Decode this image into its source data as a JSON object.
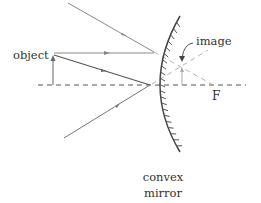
{
  "diagram": {
    "labels": {
      "object": "object",
      "image": "image",
      "focal_point": "F",
      "mirror_line1": "convex",
      "mirror_line2": "mirror"
    },
    "colors": {
      "ray": "#8a8a8a",
      "virtual_ray": "#b0b0b0",
      "axis": "#555555",
      "mirror": "#444444",
      "text": "#333333"
    }
  }
}
